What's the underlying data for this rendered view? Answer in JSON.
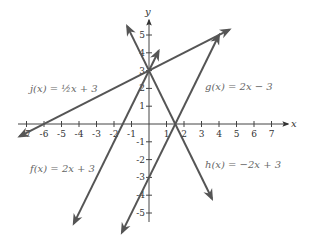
{
  "chart_data": {
    "type": "line",
    "title": "",
    "xlabel": "x",
    "ylabel": "y",
    "xlim": [
      -7,
      7
    ],
    "ylim": [
      -5,
      5
    ],
    "grid": false,
    "x_ticks": [
      "-7",
      "-6",
      "-5",
      "-4",
      "-3",
      "-2",
      "-1",
      "1",
      "2",
      "3",
      "4",
      "5",
      "6",
      "7"
    ],
    "y_ticks": [
      "-5",
      "-4",
      "-3",
      "-2",
      "-1",
      "1",
      "2",
      "3",
      "4",
      "5"
    ],
    "series": [
      {
        "name": "f(x) = 2x + 3",
        "slope": 2,
        "intercept": 3,
        "label": "f(x) = 2x + 3"
      },
      {
        "name": "g(x) = 2x − 3",
        "slope": 2,
        "intercept": -3,
        "label": "g(x) = 2x − 3"
      },
      {
        "name": "h(x) = −2x + 3",
        "slope": -2,
        "intercept": 3,
        "label": "h(x) = −2x + 3"
      },
      {
        "name": "j(x) = ½x + 3",
        "slope": 0.5,
        "intercept": 3,
        "label": "j(x) = ½x + 3"
      }
    ],
    "line_color": "#555555"
  },
  "labels": {
    "f": "f(x) = 2x + 3",
    "g": "g(x) = 2x − 3",
    "h": "h(x) = −2x + 3",
    "j": "j(x) = ½x + 3",
    "x_axis": "x",
    "y_axis": "y"
  }
}
